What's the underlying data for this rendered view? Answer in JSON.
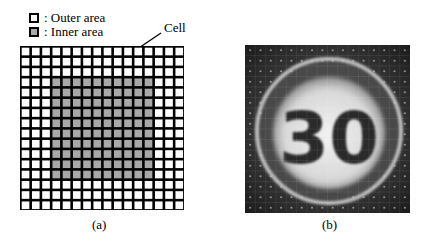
{
  "legend": {
    "items": [
      {
        "label": ": Outer area",
        "color": "#ffffff"
      },
      {
        "label": ": Inner area",
        "color": "#a8a8a8"
      }
    ]
  },
  "grid": {
    "rows": 16,
    "cols": 16,
    "inner_rows": [
      3,
      12
    ],
    "inner_cols": [
      3,
      12
    ],
    "outer_color": "#ffffff",
    "inner_color": "#a8a8a8",
    "line_color": "#000000"
  },
  "annotation": {
    "label": "Cell"
  },
  "photo": {
    "subject": "speed-limit sign",
    "text": "30",
    "grid_cells": 16
  },
  "captions": {
    "a": "(a)",
    "b": "(b)"
  }
}
